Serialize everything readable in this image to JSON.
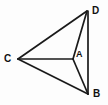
{
  "figure": {
    "type": "geometry-diagram",
    "background_color": "#fdfdfd",
    "stroke_color": "#1a1a1a",
    "label_color": "#111111",
    "width": 108,
    "height": 105,
    "points": [
      {
        "id": "C",
        "label": "C",
        "x": 18,
        "y": 59,
        "role": "left-vertex"
      },
      {
        "id": "D",
        "label": "D",
        "x": 87,
        "y": 11,
        "role": "top-right-vertex"
      },
      {
        "id": "B",
        "label": "B",
        "x": 88,
        "y": 94,
        "role": "bottom-right-vertex"
      },
      {
        "id": "A",
        "label": "A",
        "x": 73,
        "y": 59,
        "role": "interior-point"
      }
    ],
    "segments": [
      {
        "id": "CD",
        "from": "C",
        "to": "D",
        "x1": 18,
        "y1": 59,
        "x2": 87,
        "y2": 11
      },
      {
        "id": "CB",
        "from": "C",
        "to": "B",
        "x1": 18,
        "y1": 59,
        "x2": 88,
        "y2": 94
      },
      {
        "id": "CA",
        "from": "C",
        "to": "A",
        "x1": 18,
        "y1": 59,
        "x2": 73,
        "y2": 59
      },
      {
        "id": "AD",
        "from": "A",
        "to": "D",
        "x1": 73,
        "y1": 59,
        "x2": 87,
        "y2": 11
      },
      {
        "id": "AB",
        "from": "A",
        "to": "B",
        "x1": 73,
        "y1": 59,
        "x2": 88,
        "y2": 94
      },
      {
        "id": "DB",
        "from": "D",
        "to": "B",
        "x1": 88,
        "y1": 11,
        "x2": 88,
        "y2": 94
      }
    ],
    "labels": {
      "D": "D",
      "B": "B",
      "C": "C",
      "A": "A"
    }
  }
}
